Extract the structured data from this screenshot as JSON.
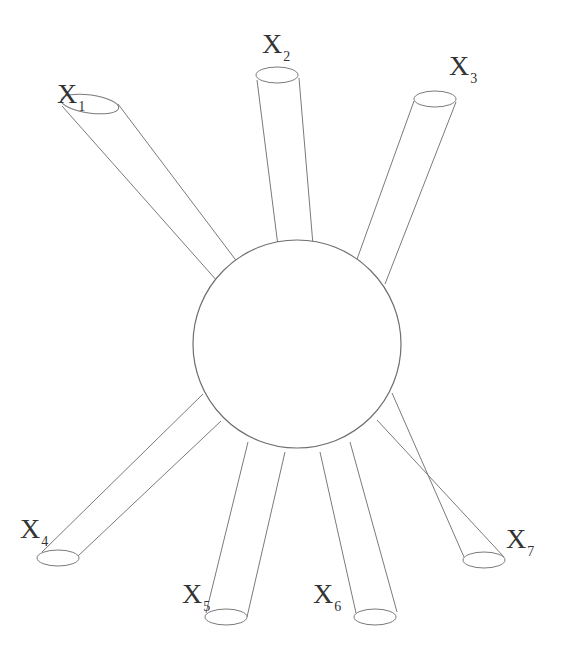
{
  "diagram": {
    "type": "hub-and-spoke",
    "center": {
      "shape": "sphere",
      "cx": 297,
      "cy": 344,
      "r": 104
    },
    "colors": {
      "stroke": "#7a7a7a",
      "label": "#333333",
      "background": "#ffffff"
    },
    "nodes": [
      {
        "id": "x1",
        "base": "X",
        "sub": "1",
        "cap": {
          "cx": 90,
          "cy": 104,
          "rx": 29,
          "ry": 9
        },
        "edges": [
          [
            62,
            106,
            218,
            282
          ],
          [
            118,
            104,
            238,
            263
          ]
        ],
        "label_pos": [
          57,
          80
        ]
      },
      {
        "id": "x2",
        "base": "X",
        "sub": "2",
        "cap": {
          "cx": 277,
          "cy": 75,
          "rx": 21,
          "ry": 8
        },
        "edges": [
          [
            257,
            80,
            278,
            246
          ],
          [
            299,
            78,
            313,
            245
          ]
        ],
        "label_pos": [
          262,
          30
        ]
      },
      {
        "id": "x3",
        "base": "X",
        "sub": "3",
        "cap": {
          "cx": 435,
          "cy": 99,
          "rx": 21,
          "ry": 8
        },
        "edges": [
          [
            414,
            101,
            356,
            262
          ],
          [
            456,
            102,
            385,
            284
          ]
        ],
        "label_pos": [
          449,
          52
        ]
      },
      {
        "id": "x4",
        "base": "X",
        "sub": "4",
        "cap": {
          "cx": 58,
          "cy": 558,
          "rx": 21,
          "ry": 8
        },
        "edges": [
          [
            42,
            552,
            203,
            394
          ],
          [
            78,
            556,
            221,
            421
          ]
        ],
        "label_pos": [
          20,
          515
        ]
      },
      {
        "id": "x5",
        "base": "X",
        "sub": "5",
        "cap": {
          "cx": 226,
          "cy": 617,
          "rx": 21,
          "ry": 8
        },
        "edges": [
          [
            206,
            613,
            248,
            442
          ],
          [
            247,
            617,
            285,
            452
          ]
        ],
        "label_pos": [
          182,
          580
        ]
      },
      {
        "id": "x6",
        "base": "X",
        "sub": "6",
        "cap": {
          "cx": 375,
          "cy": 617,
          "rx": 21,
          "ry": 8
        },
        "edges": [
          [
            356,
            613,
            320,
            452
          ],
          [
            397,
            612,
            350,
            442
          ]
        ],
        "label_pos": [
          313,
          580
        ]
      },
      {
        "id": "x7",
        "base": "X",
        "sub": "7",
        "cap": {
          "cx": 484,
          "cy": 560,
          "rx": 21,
          "ry": 8
        },
        "edges": [
          [
            464,
            557,
            392,
            393
          ],
          [
            504,
            557,
            377,
            420
          ]
        ],
        "label_pos": [
          506,
          525
        ]
      }
    ]
  },
  "labels": {
    "x1": {
      "base": "X",
      "sub": "1"
    },
    "x2": {
      "base": "X",
      "sub": "2"
    },
    "x3": {
      "base": "X",
      "sub": "3"
    },
    "x4": {
      "base": "X",
      "sub": "4"
    },
    "x5": {
      "base": "X",
      "sub": "5"
    },
    "x6": {
      "base": "X",
      "sub": "6"
    },
    "x7": {
      "base": "X",
      "sub": "7"
    }
  }
}
